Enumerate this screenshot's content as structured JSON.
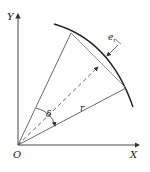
{
  "diagram": {
    "labels": {
      "y_axis": "Y",
      "x_axis": "X",
      "origin": "O",
      "angle": "δ",
      "radius": "r",
      "error": "e",
      "error_sub": "r"
    },
    "colors": {
      "stroke": "#333333",
      "background": "#ffffff"
    }
  }
}
